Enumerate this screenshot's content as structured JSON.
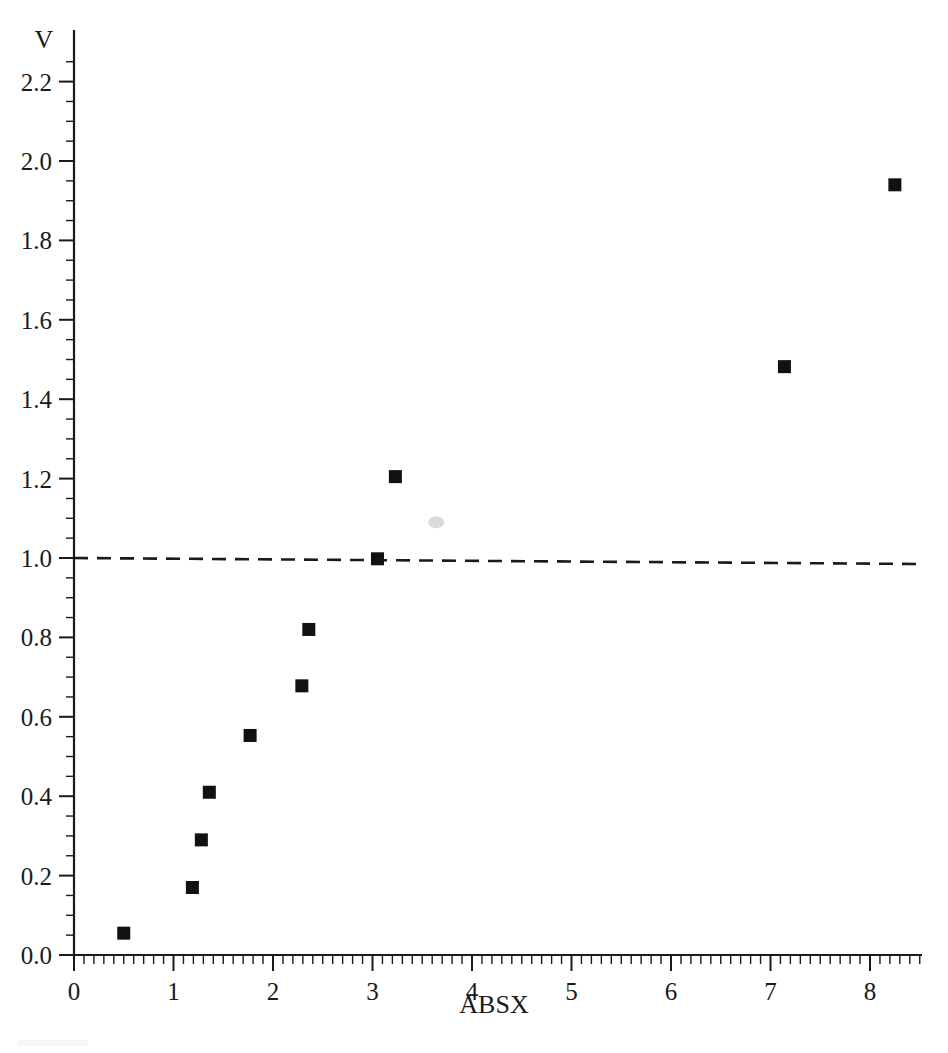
{
  "chart_data": {
    "type": "scatter",
    "title": "",
    "xlabel": "ABSX",
    "ylabel": "V",
    "xlim": [
      0,
      8.55
    ],
    "ylim": [
      0.0,
      2.26
    ],
    "grid": false,
    "legend": "none",
    "x_ticks": [
      0,
      1,
      2,
      3,
      4,
      5,
      6,
      7,
      8
    ],
    "x_tick_labels": [
      "0",
      "1",
      "2",
      "3",
      "4",
      "5",
      "6",
      "7",
      "8"
    ],
    "x_minor_step": 0.1,
    "y_ticks": [
      0.0,
      0.2,
      0.4,
      0.6,
      0.8,
      1.0,
      1.2,
      1.4,
      1.6,
      1.8,
      2.0,
      2.2
    ],
    "y_tick_labels": [
      "0.0",
      "0.2",
      "0.4",
      "0.6",
      "0.8",
      "1.0",
      "1.2",
      "1.4",
      "1.6",
      "1.8",
      "2.0",
      "2.2"
    ],
    "y_minor_step": 0.05,
    "marker": "square",
    "marker_color": "#111111",
    "points": [
      {
        "x": 0.5,
        "y": 0.055
      },
      {
        "x": 1.19,
        "y": 0.17
      },
      {
        "x": 1.28,
        "y": 0.29
      },
      {
        "x": 1.36,
        "y": 0.41
      },
      {
        "x": 1.77,
        "y": 0.553
      },
      {
        "x": 2.29,
        "y": 0.678
      },
      {
        "x": 2.36,
        "y": 0.82
      },
      {
        "x": 3.05,
        "y": 0.998
      },
      {
        "x": 3.23,
        "y": 1.205
      },
      {
        "x": 7.14,
        "y": 1.482
      },
      {
        "x": 8.25,
        "y": 1.94
      }
    ],
    "reference_line": {
      "orientation": "horizontal",
      "y": 1.0,
      "style": "dashed",
      "color": "#1a1a1a",
      "x_start": 0.0,
      "x_end": 8.55
    },
    "annotations": [
      {
        "kind": "scan-artifact",
        "x": 3.64,
        "y": 1.09,
        "color": "#cfcfcf"
      }
    ]
  }
}
